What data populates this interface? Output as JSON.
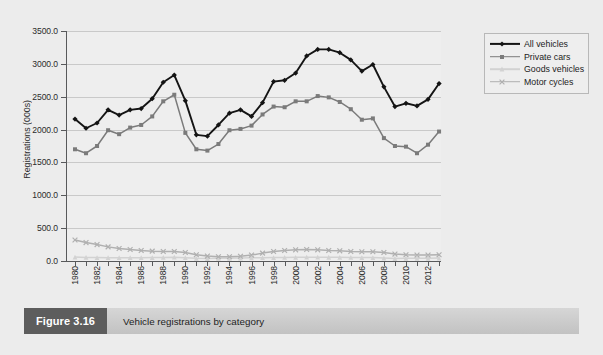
{
  "figure": {
    "tag": "Figure 3.16",
    "caption": "Vehicle registrations by category"
  },
  "legend": {
    "position": "top-right",
    "items": [
      {
        "label": "All vehicles",
        "color": "#141414",
        "marker": "diamond"
      },
      {
        "label": "Private cars",
        "color": "#7b7b7b",
        "marker": "square"
      },
      {
        "label": "Goods vehicles",
        "color": "#d2d2d2",
        "marker": "triangle"
      },
      {
        "label": "Motor cycles",
        "color": "#b0b0b0",
        "marker": "cross"
      }
    ]
  },
  "chart_data": {
    "type": "line",
    "title": "",
    "xlabel": "",
    "ylabel": "Registrations (000s)",
    "ylim": [
      0,
      3500
    ],
    "ytick_step": 500,
    "ytick_labels": [
      "0.0",
      "500.0",
      "1000.0",
      "1500.0",
      "2000.0",
      "2500.0",
      "3000.0",
      "3500.0"
    ],
    "grid": true,
    "x": [
      1980,
      1981,
      1982,
      1983,
      1984,
      1985,
      1986,
      1987,
      1988,
      1989,
      1990,
      1991,
      1992,
      1993,
      1994,
      1995,
      1996,
      1997,
      1998,
      1999,
      2000,
      2001,
      2002,
      2003,
      2004,
      2005,
      2006,
      2007,
      2008,
      2009,
      2010,
      2011,
      2012,
      2013
    ],
    "xtick_labels": [
      "1980",
      "1982",
      "1984",
      "1986",
      "1988",
      "1990",
      "1992",
      "1994",
      "1996",
      "1998",
      "2000",
      "2002",
      "2004",
      "2006",
      "2008",
      "2010",
      "2012"
    ],
    "xtick_step": 2,
    "series": [
      {
        "name": "All vehicles",
        "color": "#141414",
        "values": [
          2160,
          2020,
          2100,
          2300,
          2220,
          2300,
          2320,
          2470,
          2720,
          2830,
          2440,
          1920,
          1900,
          2070,
          2250,
          2300,
          2200,
          2410,
          2730,
          2750,
          2860,
          3120,
          3220,
          3220,
          3170,
          3060,
          2890,
          2990,
          2650,
          2350,
          2400,
          2360,
          2460,
          2700
        ]
      },
      {
        "name": "Private cars",
        "color": "#7b7b7b",
        "values": [
          1700,
          1640,
          1750,
          1990,
          1930,
          2030,
          2070,
          2200,
          2430,
          2530,
          1950,
          1700,
          1680,
          1780,
          1990,
          2010,
          2060,
          2230,
          2350,
          2340,
          2430,
          2430,
          2510,
          2490,
          2420,
          2310,
          2150,
          2170,
          1870,
          1750,
          1740,
          1640,
          1770,
          1970
        ]
      },
      {
        "name": "Goods vehicles",
        "color": "#d2d2d2",
        "values": [
          60,
          55,
          52,
          50,
          50,
          50,
          50,
          52,
          55,
          58,
          50,
          40,
          38,
          40,
          42,
          45,
          48,
          50,
          52,
          54,
          56,
          58,
          58,
          57,
          56,
          54,
          52,
          52,
          45,
          38,
          40,
          40,
          42,
          45
        ]
      },
      {
        "name": "Motor cycles",
        "color": "#b0b0b0",
        "values": [
          320,
          280,
          250,
          215,
          190,
          175,
          160,
          150,
          145,
          145,
          130,
          95,
          75,
          65,
          65,
          72,
          90,
          120,
          145,
          160,
          170,
          175,
          170,
          160,
          155,
          145,
          140,
          140,
          130,
          105,
          95,
          90,
          90,
          95
        ]
      }
    ]
  }
}
